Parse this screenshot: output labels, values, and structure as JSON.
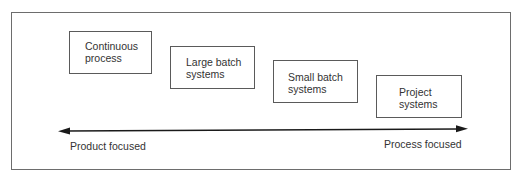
{
  "diagram": {
    "type": "process-spectrum",
    "boxes": [
      {
        "id": "continuous-process",
        "label": "Continuous\nprocess"
      },
      {
        "id": "large-batch-systems",
        "label": "Large batch\nsystems"
      },
      {
        "id": "small-batch-systems",
        "label": "Small batch\nsystems"
      },
      {
        "id": "project-systems",
        "label": "Project\nsystems"
      }
    ],
    "axis": {
      "direction": "bidirectional",
      "left_label": "Product focused",
      "right_label": "Process focused"
    },
    "colors": {
      "stroke": "#5a5a5a",
      "text": "#333333",
      "arrow": "#1a1a1a"
    }
  }
}
